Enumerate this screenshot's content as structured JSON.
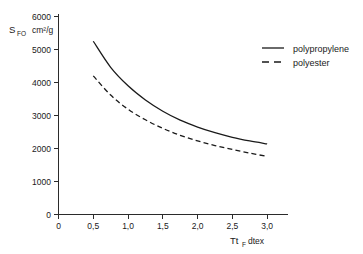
{
  "chart_data": {
    "type": "line",
    "title": "",
    "subtitle": "",
    "xlabel": "Tt_F dtex",
    "xlabel_main": "Tt",
    "xlabel_sub": "F",
    "xlabel_unit": "dtex",
    "ylabel": "S_FO cm²/g",
    "ylabel_main": "S",
    "ylabel_sub": "FO",
    "ylabel_unit": "cm²/g",
    "xlim": [
      0,
      3.3
    ],
    "ylim": [
      0,
      6000
    ],
    "xticks": [
      0,
      0.5,
      1.0,
      1.5,
      2.0,
      2.5,
      3.0
    ],
    "xticklabels": [
      "0",
      "0,5",
      "1,0",
      "1,5",
      "2,0",
      "2,5",
      "3,0"
    ],
    "yticks": [
      0,
      1000,
      2000,
      3000,
      4000,
      5000,
      6000
    ],
    "yticklabels": [
      "0",
      "1000",
      "2000",
      "3000",
      "4000",
      "5000",
      "6000"
    ],
    "grid": false,
    "legend_position": "upper right",
    "x": [
      0.5,
      0.75,
      1.0,
      1.25,
      1.5,
      1.75,
      2.0,
      2.25,
      2.5,
      2.75,
      3.0
    ],
    "series": [
      {
        "name": "polypropylene",
        "style": "solid",
        "color": "#1a1a1a",
        "values": [
          5250,
          4460,
          3900,
          3470,
          3130,
          2860,
          2650,
          2480,
          2340,
          2230,
          2140
        ]
      },
      {
        "name": "polyester",
        "style": "dashed",
        "color": "#1a1a1a",
        "values": [
          4200,
          3620,
          3190,
          2870,
          2610,
          2400,
          2230,
          2090,
          1970,
          1860,
          1760
        ]
      }
    ]
  },
  "legend": {
    "entries": [
      {
        "label": "polypropylene",
        "style": "solid"
      },
      {
        "label": "polyester",
        "style": "dashed"
      }
    ]
  },
  "colors": {
    "background": "#ffffff",
    "axis": "#2b2b2b",
    "line": "#1a1a1a",
    "text": "#1a1a1a"
  }
}
